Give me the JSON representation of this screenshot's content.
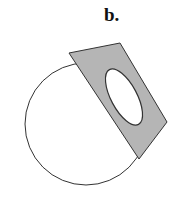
{
  "figure": {
    "label": "b.",
    "shapes": {
      "circle": {
        "cx": 86,
        "cy": 124,
        "r": 61,
        "stroke": "#333333",
        "fill": "#ffffff"
      },
      "plate": {
        "points": "69,53 120,43 167,122 139,159",
        "fill": "#b5b5b5",
        "stroke": "#333333"
      },
      "hole": {
        "cx": 124,
        "cy": 97,
        "rx": 13,
        "ry": 31,
        "rotate": -28,
        "fill": "#ffffff",
        "stroke": "#333333"
      }
    }
  }
}
